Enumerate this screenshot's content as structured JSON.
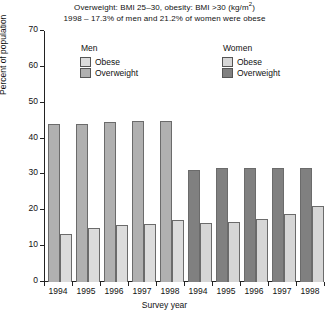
{
  "title": {
    "line1_pre": "Overweight: BMI 25–30, obesity: BMI >30 (kg/m",
    "line1_sup": "2",
    "line1_post": ")",
    "line2": "1998 – 17.3% of men and 21.2% of women were obese"
  },
  "legend": {
    "men": {
      "title": "Men",
      "obese_label": "Obese",
      "overweight_label": "Overweight",
      "obese_color": "#dcdcdc",
      "overweight_color": "#b0b0b0"
    },
    "women": {
      "title": "Women",
      "obese_label": "Obese",
      "overweight_label": "Overweight",
      "obese_color": "#d6d6d6",
      "overweight_color": "#808080"
    }
  },
  "chart_data": {
    "type": "bar",
    "title": "Overweight: BMI 25–30, obesity: BMI >30 (kg/m2)",
    "subtitle": "1998 – 17.3% of men and 21.2% of women were obese",
    "xlabel": "Survey year",
    "ylabel": "Percent of population",
    "ylim": [
      0,
      70
    ],
    "yticks": [
      0,
      10,
      20,
      30,
      40,
      50,
      60,
      70
    ],
    "grid": false,
    "legend_position": "top",
    "categories": [
      "1994",
      "1995",
      "1996",
      "1997",
      "1998",
      "1994",
      "1995",
      "1996",
      "1997",
      "1998"
    ],
    "groups": [
      "Men",
      "Men",
      "Men",
      "Men",
      "Men",
      "Women",
      "Women",
      "Women",
      "Women",
      "Women"
    ],
    "series": [
      {
        "name": "Overweight",
        "values": [
          44.0,
          44.0,
          44.5,
          45.0,
          45.0,
          31.2,
          31.8,
          31.8,
          31.8,
          31.8
        ]
      },
      {
        "name": "Obese",
        "values": [
          13.5,
          15.0,
          16.0,
          16.3,
          17.3,
          16.5,
          16.7,
          17.5,
          19.0,
          21.2
        ]
      }
    ],
    "bars": [
      {
        "year": "1994",
        "group": "Men",
        "series": "Overweight",
        "value": 44.0,
        "color": "#b0b0b0"
      },
      {
        "year": "1994",
        "group": "Men",
        "series": "Obese",
        "value": 13.5,
        "color": "#dcdcdc"
      },
      {
        "year": "1995",
        "group": "Men",
        "series": "Overweight",
        "value": 44.0,
        "color": "#b0b0b0"
      },
      {
        "year": "1995",
        "group": "Men",
        "series": "Obese",
        "value": 15.0,
        "color": "#dcdcdc"
      },
      {
        "year": "1996",
        "group": "Men",
        "series": "Overweight",
        "value": 44.5,
        "color": "#b0b0b0"
      },
      {
        "year": "1996",
        "group": "Men",
        "series": "Obese",
        "value": 16.0,
        "color": "#dcdcdc"
      },
      {
        "year": "1997",
        "group": "Men",
        "series": "Overweight",
        "value": 45.0,
        "color": "#b0b0b0"
      },
      {
        "year": "1997",
        "group": "Men",
        "series": "Obese",
        "value": 16.3,
        "color": "#dcdcdc"
      },
      {
        "year": "1998",
        "group": "Men",
        "series": "Overweight",
        "value": 45.0,
        "color": "#b0b0b0"
      },
      {
        "year": "1998",
        "group": "Men",
        "series": "Obese",
        "value": 17.3,
        "color": "#dcdcdc"
      },
      {
        "year": "1994",
        "group": "Women",
        "series": "Overweight",
        "value": 31.2,
        "color": "#808080"
      },
      {
        "year": "1994",
        "group": "Women",
        "series": "Obese",
        "value": 16.5,
        "color": "#d6d6d6"
      },
      {
        "year": "1995",
        "group": "Women",
        "series": "Overweight",
        "value": 31.8,
        "color": "#808080"
      },
      {
        "year": "1995",
        "group": "Women",
        "series": "Obese",
        "value": 16.7,
        "color": "#d6d6d6"
      },
      {
        "year": "1996",
        "group": "Women",
        "series": "Overweight",
        "value": 31.8,
        "color": "#808080"
      },
      {
        "year": "1996",
        "group": "Women",
        "series": "Obese",
        "value": 17.5,
        "color": "#d6d6d6"
      },
      {
        "year": "1997",
        "group": "Women",
        "series": "Overweight",
        "value": 31.8,
        "color": "#808080"
      },
      {
        "year": "1997",
        "group": "Women",
        "series": "Obese",
        "value": 19.0,
        "color": "#d6d6d6"
      },
      {
        "year": "1998",
        "group": "Women",
        "series": "Overweight",
        "value": 31.8,
        "color": "#808080"
      },
      {
        "year": "1998",
        "group": "Women",
        "series": "Obese",
        "value": 21.2,
        "color": "#d6d6d6"
      }
    ]
  },
  "axes": {
    "y_title": "Percent of population",
    "x_title": "Survey year"
  }
}
